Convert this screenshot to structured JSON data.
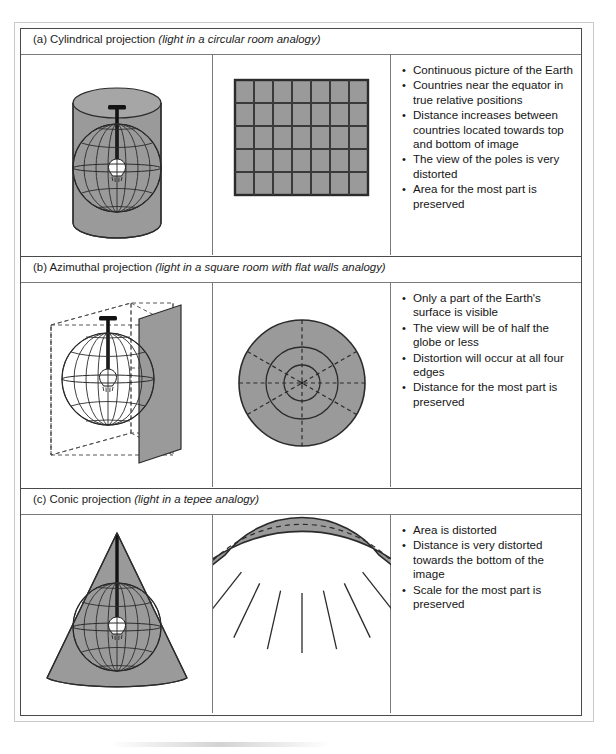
{
  "figure": {
    "title_hidden": "",
    "sections": [
      {
        "id": "cylindrical",
        "label_prefix": "(a) Cylindrical projection",
        "label_italic": "(light in a circular room analogy)",
        "globe_caption": "globe inside cylinder with light source",
        "projection_caption": "rectangular grid graticule, 7 columns by 5 rows",
        "notes": [
          "Continuous picture of the Earth",
          "Countries near the equator in true relative positions",
          "Distance increases between countries located towards top and bottom of image",
          "The view of the poles is very distorted",
          "Area for the most part is preserved"
        ]
      },
      {
        "id": "azimuthal",
        "label_prefix": "(b) Azimuthal projection",
        "label_italic": "(light in a square room with flat walls analogy)",
        "globe_caption": "globe inside dashed cube with one flat shaded wall",
        "projection_caption": "shaded circle with concentric rings and radial dashed lines",
        "notes": [
          "Only a part of the Earth's surface is visible",
          "The view will be of half the globe or less",
          "Distortion will occur at all four edges",
          "Distance for the most part is preserved"
        ]
      },
      {
        "id": "conic",
        "label_prefix": "(c) Conic projection",
        "label_italic": "(light in a tepee analogy)",
        "globe_caption": "globe inside a cone with light source",
        "projection_caption": "unrolled fan shaped sector with meridian lines",
        "notes": [
          "Area is distorted",
          "Distance is very distorted towards the bottom of the image",
          "Scale for the most part is preserved"
        ]
      }
    ]
  },
  "colors": {
    "shape_fill": "#9a9a9a",
    "shape_fill_light": "#a8a8a8",
    "line": "#2b2b2b",
    "grid_line": "#3a3a3a",
    "border": "#4a4a4a",
    "divider": "#7a7a7a",
    "text": "#151515",
    "page_background": "#ffffff"
  }
}
